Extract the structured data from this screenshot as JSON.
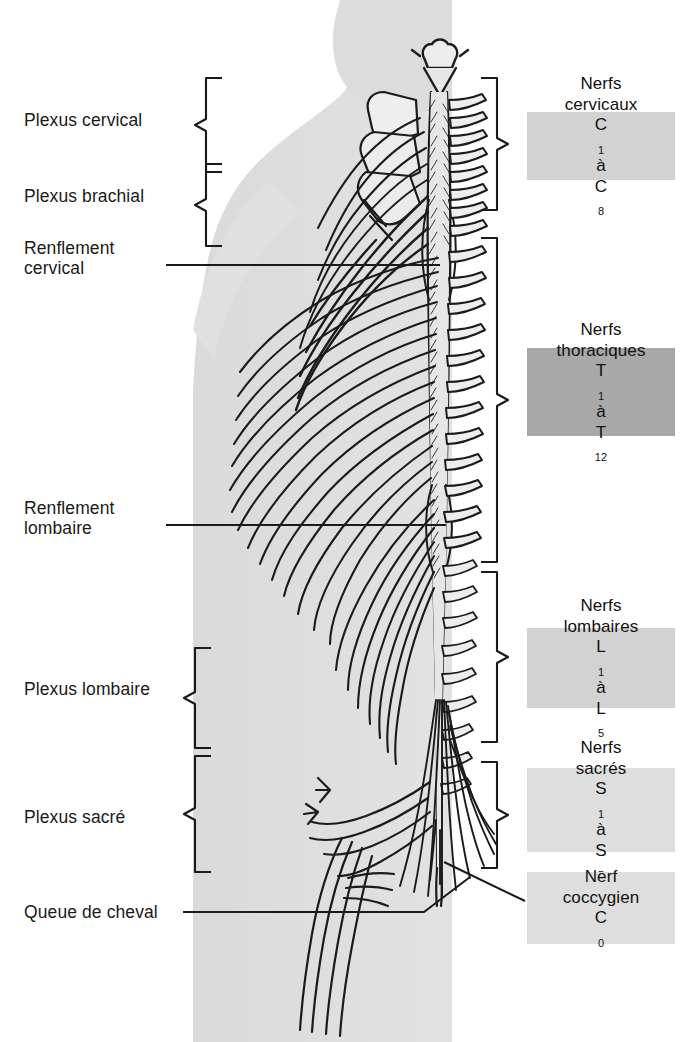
{
  "figure": {
    "language": "fr"
  },
  "colors": {
    "ink": "#1a1a1a",
    "silhouette": "#dcdcdc",
    "cord_fill": "#e4e4e4",
    "box_light": "#d2d2d2",
    "box_medium": "#c8c8c8",
    "box_dark": "#a8a8a8",
    "box_pale": "#dedede",
    "page": "#ffffff"
  },
  "left_labels": [
    {
      "id": "plexus-cervical",
      "text": "Plexus cervical",
      "x": 24,
      "y": 110,
      "bracket": true
    },
    {
      "id": "plexus-brachial",
      "text": "Plexus brachial",
      "x": 24,
      "y": 186,
      "bracket": true
    },
    {
      "id": "renflement-cervical",
      "text": "Renflement\ncervical",
      "x": 24,
      "y": 238,
      "bracket": false
    },
    {
      "id": "renflement-lombaire",
      "text": "Renflement\nlombaire",
      "x": 24,
      "y": 505,
      "bracket": false
    },
    {
      "id": "plexus-lombaire",
      "text": "Plexus lombaire",
      "x": 24,
      "y": 670,
      "bracket": true
    },
    {
      "id": "plexus-sacre",
      "text": "Plexus sacré",
      "x": 24,
      "y": 805,
      "bracket": true
    },
    {
      "id": "queue-de-cheval",
      "text": "Queue de cheval",
      "x": 24,
      "y": 908,
      "bracket": false
    }
  ],
  "right_boxes": [
    {
      "id": "nerfs-cervicaux",
      "line1": "Nerfs",
      "line2": "cervicaux",
      "symbol_from": "C",
      "sub_from": "1",
      "joiner": "à",
      "symbol_to": "C",
      "sub_to": "8",
      "shade": "#d2d2d2",
      "x": 527,
      "y": 112,
      "w": 148,
      "h": 68
    },
    {
      "id": "nerfs-thoraciques",
      "line1": "Nerfs",
      "line2": "thoraciques",
      "symbol_from": "T",
      "sub_from": "1",
      "joiner": "à",
      "symbol_to": "T",
      "sub_to": "12",
      "shade": "#a8a8a8",
      "x": 527,
      "y": 348,
      "w": 148,
      "h": 88
    },
    {
      "id": "nerfs-lombaires",
      "line1": "Nerfs",
      "line2": "lombaires",
      "symbol_from": "L",
      "sub_from": "1",
      "joiner": "à",
      "symbol_to": "L",
      "sub_to": "5",
      "shade": "#d2d2d2",
      "x": 527,
      "y": 628,
      "w": 148,
      "h": 80
    },
    {
      "id": "nerfs-sacres",
      "line1": "Nerfs",
      "line2": "sacrés",
      "symbol_from": "S",
      "sub_from": "1",
      "joiner": "à",
      "symbol_to": "S",
      "sub_to": "5",
      "shade": "#dedede",
      "x": 527,
      "y": 768,
      "w": 148,
      "h": 84
    },
    {
      "id": "nerf-coccygien",
      "line1": "Nerf",
      "line2": "coccygien",
      "symbol_from": "C",
      "sub_from": "0",
      "joiner": "",
      "symbol_to": "",
      "sub_to": "",
      "shade": "#dedede",
      "x": 527,
      "y": 872,
      "w": 148,
      "h": 72
    }
  ],
  "left_brackets": [
    {
      "id": "bracket-plexus-cervical",
      "x": 196,
      "y": 80,
      "h": 90,
      "tip_dx": -14
    },
    {
      "id": "bracket-plexus-brachial",
      "x": 196,
      "y": 166,
      "h": 78,
      "tip_dx": -14
    },
    {
      "id": "bracket-plexus-lombaire",
      "x": 185,
      "y": 650,
      "h": 96,
      "tip_dx": -14
    },
    {
      "id": "bracket-plexus-sacre",
      "x": 185,
      "y": 758,
      "h": 112,
      "tip_dx": -14
    }
  ],
  "right_brackets": [
    {
      "id": "bracket-nerfs-cervicaux",
      "x": 481,
      "y": 78,
      "h": 130,
      "tip_dx": 14
    },
    {
      "id": "bracket-nerfs-thoraciques",
      "x": 481,
      "y": 238,
      "h": 322,
      "tip_dx": 14
    },
    {
      "id": "bracket-nerfs-lombaires",
      "x": 481,
      "y": 572,
      "h": 168,
      "tip_dx": 14
    },
    {
      "id": "bracket-nerfs-sacres",
      "x": 481,
      "y": 762,
      "h": 104,
      "tip_dx": 14
    }
  ],
  "leaders": [
    {
      "id": "leader-renflement-cervical",
      "points": "160,265 440,265"
    },
    {
      "id": "leader-renflement-lombaire",
      "points": "160,525 450,525"
    },
    {
      "id": "leader-queue-de-cheval",
      "points": "180,912 425,912 470,878"
    },
    {
      "id": "leader-nerf-coccygien",
      "points": "527,900 440,862"
    }
  ]
}
